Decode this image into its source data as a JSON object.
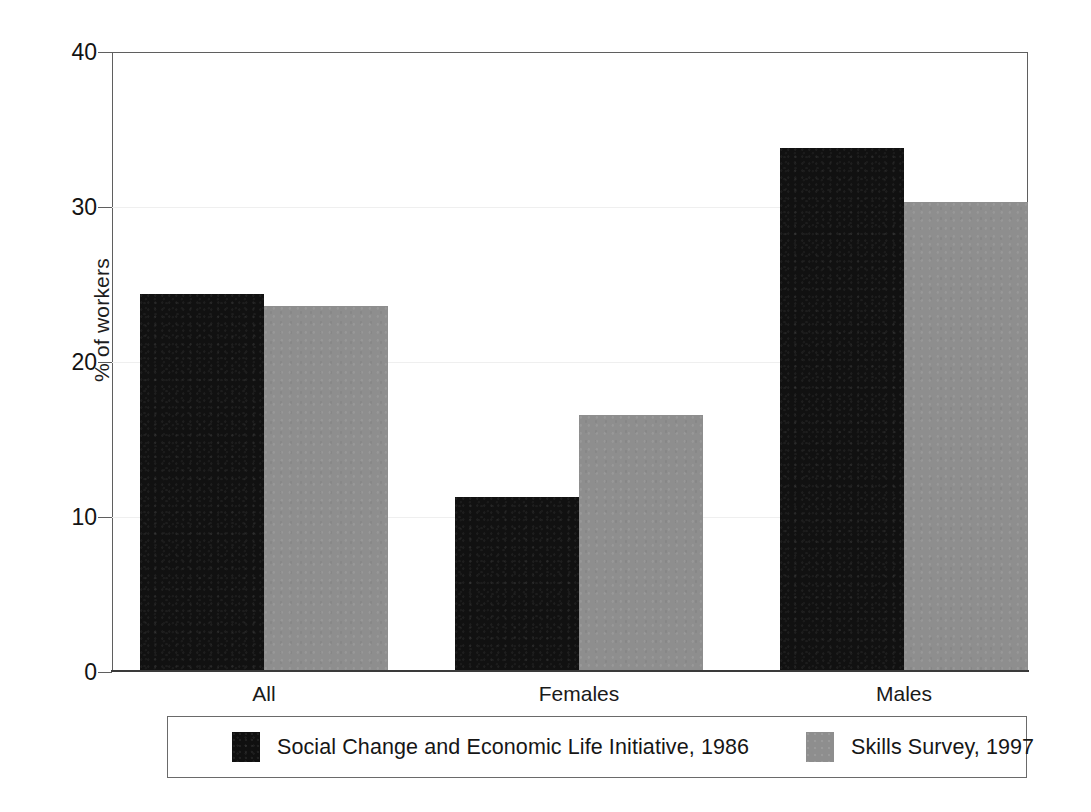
{
  "chart_data": {
    "type": "bar",
    "title": "",
    "subtitle": "",
    "xlabel": "",
    "ylabel": "% of workers",
    "categories": [
      "All",
      "Females",
      "Males"
    ],
    "series": [
      {
        "name": "Social Change and Economic Life Initiative, 1986",
        "color": "#111111",
        "values": [
          24.4,
          11.3,
          33.8
        ]
      },
      {
        "name": "Skills Survey, 1997",
        "color": "#8e8e8e",
        "values": [
          23.6,
          16.6,
          30.3
        ]
      }
    ],
    "ylim": [
      0,
      40
    ],
    "yticks": [
      0,
      10,
      20,
      30,
      40
    ],
    "ytick_labels": [
      "0",
      "10",
      "20",
      "30",
      "40"
    ],
    "grid": "faint-horizontal",
    "legend_position": "bottom-boxed"
  },
  "axes": {
    "y_title": "% of workers",
    "y_tick_labels": [
      "40",
      "30",
      "20",
      "10",
      "0"
    ],
    "x_tick_labels": [
      "All",
      "Females",
      "Males"
    ]
  },
  "legend": {
    "entries": [
      {
        "label": "Social Change and Economic Life Initiative, 1986",
        "swatch": "dark-swatch"
      },
      {
        "label": "Skills Survey, 1997",
        "swatch": "light-swatch"
      }
    ]
  },
  "colors": {
    "series_dark": "#111111",
    "series_light": "#8e8e8e",
    "axis": "#5f5f5f",
    "baseline": "#3a3a3a",
    "gridline": "#efefef",
    "text": "#161616",
    "background": "#ffffff"
  },
  "caption_remnant": ""
}
